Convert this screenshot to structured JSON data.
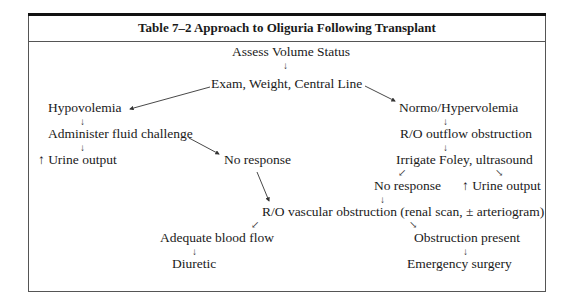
{
  "table": {
    "title": "Table 7–2  Approach to Oliguria Following Transplant"
  },
  "nodes": {
    "assess": "Assess Volume Status",
    "exam": "Exam, Weight, Central Line",
    "hypovolemia": "Hypovolemia",
    "fluid_challenge": "Administer fluid challenge",
    "left_urine_output": "↑ Urine output",
    "left_no_response": "No response",
    "normo": "Normo/Hypervolemia",
    "outflow": "R/O outflow obstruction",
    "irrigate": "Irrigate Foley, ultrasound",
    "right_no_response": "No response",
    "right_urine_output": "↑ Urine output",
    "vascular": "R/O vascular obstruction (renal scan, ± arteriogram)",
    "adequate_flow": "Adequate blood flow",
    "diuretic": "Diuretic",
    "obstruction_present": "Obstruction present",
    "emergency_surgery": "Emergency surgery"
  },
  "glyphs": {
    "down_arrow": "↓",
    "down_left_arrow": "↙",
    "down_right_arrow": "↘"
  },
  "edges": [
    [
      "assess",
      "exam"
    ],
    [
      "exam",
      "hypovolemia"
    ],
    [
      "exam",
      "normo"
    ],
    [
      "hypovolemia",
      "fluid_challenge"
    ],
    [
      "fluid_challenge",
      "left_urine_output"
    ],
    [
      "fluid_challenge",
      "left_no_response"
    ],
    [
      "left_no_response",
      "vascular"
    ],
    [
      "normo",
      "outflow"
    ],
    [
      "outflow",
      "irrigate"
    ],
    [
      "irrigate",
      "right_no_response"
    ],
    [
      "irrigate",
      "right_urine_output"
    ],
    [
      "right_no_response",
      "vascular"
    ],
    [
      "vascular",
      "adequate_flow"
    ],
    [
      "vascular",
      "obstruction_present"
    ],
    [
      "adequate_flow",
      "diuretic"
    ],
    [
      "obstruction_present",
      "emergency_surgery"
    ]
  ]
}
